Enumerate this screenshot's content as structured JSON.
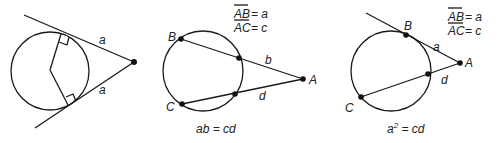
{
  "figures": [
    {
      "id": "tangent-tangent",
      "labels": {
        "upper_segment": "a",
        "lower_segment": "a"
      }
    },
    {
      "id": "secant-secant",
      "definitions": {
        "line1_seg": "AB",
        "line1_eq": "= a",
        "line2_seg": "AC",
        "line2_eq": "= c"
      },
      "points": {
        "B": "B",
        "C": "C",
        "A": "A"
      },
      "labels": {
        "upper_external": "b",
        "lower_external": "d"
      },
      "caption": "ab = cd"
    },
    {
      "id": "tangent-secant",
      "definitions": {
        "line1_seg": "AB",
        "line1_eq": "= a",
        "line2_seg": "AC",
        "line2_eq": "= c"
      },
      "points": {
        "B": "B",
        "C": "C",
        "A": "A"
      },
      "labels": {
        "tangent_segment": "a",
        "external_segment": "d"
      },
      "caption_base": "a",
      "caption_exp": "2",
      "caption_rest": " = cd"
    }
  ],
  "colors": {
    "stroke": "#1a1a1a",
    "text": "#222222",
    "background": "#ffffff"
  }
}
